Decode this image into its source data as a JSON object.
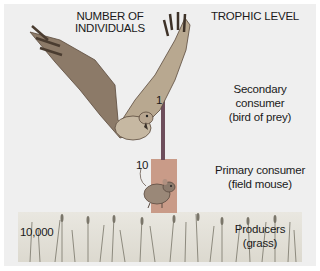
{
  "headers": {
    "left": "NUMBER OF\nINDIVIDUALS",
    "left_line1": "NUMBER OF",
    "left_line2": "INDIVIDUALS",
    "right": "TROPHIC LEVEL"
  },
  "levels": [
    {
      "name_line1": "Secondary",
      "name_line2": "consumer",
      "name_line3": "(bird of prey)",
      "count": "1",
      "color": "#7a5a68"
    },
    {
      "name_line1": "Primary consumer",
      "name_line2": "(field mouse)",
      "count": "10",
      "color": "#c79a86"
    },
    {
      "name_line1": "Producers",
      "name_line2": "(grass)",
      "count": "10,000",
      "color": "#e6e3da"
    }
  ],
  "illustrations": [
    "hawk-illustration",
    "mouse-illustration",
    "grass-illustration"
  ]
}
